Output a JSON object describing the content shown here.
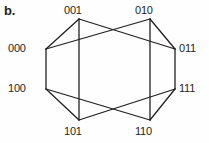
{
  "figure": {
    "caption": "b.",
    "title": "b.",
    "type": "hypercube-graph",
    "width": 209,
    "height": 143,
    "background_color": "#fefefe",
    "edge_color": "#231f20",
    "text_color": "#231f20",
    "edge_width": 1.3
  },
  "chart_data": {
    "type": "diagram",
    "title": "b.",
    "xlabel": "",
    "ylabel": "",
    "graph_name": "3-cube (Q3) hypercube graph",
    "vertex_count": 8,
    "edge_count": 12,
    "nodes": [
      {
        "id": "000",
        "label": "000",
        "x": 46,
        "y": 49,
        "label_x": 8,
        "label_y": 43
      },
      {
        "id": "001",
        "label": "001",
        "x": 79,
        "y": 19,
        "label_x": 64,
        "label_y": 5
      },
      {
        "id": "010",
        "label": "010",
        "x": 150,
        "y": 19,
        "label_x": 135,
        "label_y": 5
      },
      {
        "id": "011",
        "label": "011",
        "x": 175,
        "y": 49,
        "label_x": 179,
        "label_y": 43
      },
      {
        "id": "100",
        "label": "100",
        "x": 46,
        "y": 89,
        "label_x": 8,
        "label_y": 83
      },
      {
        "id": "111",
        "label": "111",
        "x": 175,
        "y": 89,
        "label_x": 179,
        "label_y": 83
      },
      {
        "id": "101",
        "label": "101",
        "x": 79,
        "y": 120,
        "label_x": 64,
        "label_y": 126
      },
      {
        "id": "110",
        "label": "110",
        "x": 150,
        "y": 120,
        "label_x": 135,
        "label_y": 126
      }
    ],
    "edges": [
      {
        "from": "000",
        "to": "001",
        "name": "edge-000-001"
      },
      {
        "from": "000",
        "to": "010",
        "name": "edge-000-010"
      },
      {
        "from": "000",
        "to": "100",
        "name": "edge-000-100"
      },
      {
        "from": "001",
        "to": "011",
        "name": "edge-001-011"
      },
      {
        "from": "001",
        "to": "101",
        "name": "edge-001-101"
      },
      {
        "from": "010",
        "to": "011",
        "name": "edge-010-011"
      },
      {
        "from": "010",
        "to": "110",
        "name": "edge-010-110"
      },
      {
        "from": "011",
        "to": "111",
        "name": "edge-011-111"
      },
      {
        "from": "100",
        "to": "101",
        "name": "edge-100-101"
      },
      {
        "from": "100",
        "to": "110",
        "name": "edge-100-110"
      },
      {
        "from": "101",
        "to": "111",
        "name": "edge-101-111"
      },
      {
        "from": "110",
        "to": "111",
        "name": "edge-110-111"
      }
    ],
    "labels": [
      "000",
      "001",
      "010",
      "011",
      "100",
      "101",
      "110",
      "111"
    ],
    "grid": false,
    "legend": null
  }
}
